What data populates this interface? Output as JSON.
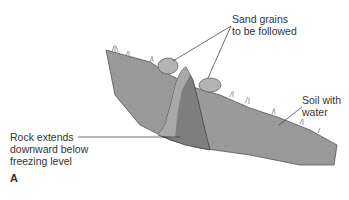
{
  "diagram": {
    "labels": {
      "sand_line1": "Sand grains",
      "sand_line2": "to be followed",
      "soil_line1": "Soil with",
      "soil_line2": "water",
      "rock_line1": "Rock extends",
      "rock_line2": "downward below",
      "rock_line3": "freezing level"
    },
    "panel_label": "A",
    "colors": {
      "soil": "#9a9a9a",
      "rock_light": "#a8a8a8",
      "rock_dark": "#7e7e7e",
      "grain": "#b4b4b4",
      "text": "#333333",
      "leader": "#333333"
    }
  }
}
